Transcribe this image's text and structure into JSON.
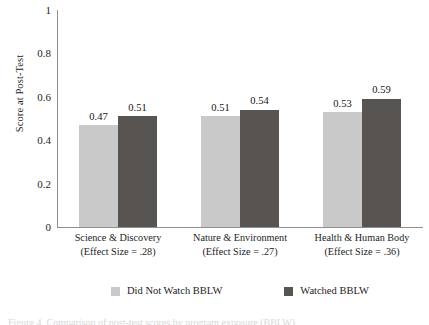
{
  "chart_data": {
    "type": "bar",
    "title": "",
    "xlabel": "",
    "ylabel": "Score at Post-Test",
    "ylim": [
      0,
      1
    ],
    "yticks": [
      "0",
      "0.2",
      "0.4",
      "0.6",
      "0.8",
      "1"
    ],
    "grid": false,
    "legend_position": "bottom",
    "categories": [
      "Science & Discovery",
      "Nature & Environment",
      "Health & Human Body"
    ],
    "category_sublabels": [
      "(Effect Size = .28)",
      "(Effect Size = .27)",
      "(Effect Size = .36)"
    ],
    "series": [
      {
        "name": "Did Not Watch BBLW",
        "color": "#c9c9c9",
        "values": [
          0.47,
          0.51,
          0.53
        ],
        "labels": [
          "0.47",
          "0.51",
          "0.53"
        ]
      },
      {
        "name": "Watched BBLW",
        "color": "#585451",
        "values": [
          0.51,
          0.54,
          0.59
        ],
        "labels": [
          "0.51",
          "0.54",
          "0.59"
        ]
      }
    ]
  },
  "axis": {
    "y_title": "Score at Post-Test",
    "y_ticks": [
      {
        "label": "1",
        "value": 1.0
      },
      {
        "label": "0.8",
        "value": 0.8
      },
      {
        "label": "0.6",
        "value": 0.6
      },
      {
        "label": "0.4",
        "value": 0.4
      },
      {
        "label": "0.2",
        "value": 0.2
      },
      {
        "label": "0",
        "value": 0.0
      }
    ]
  },
  "legend": {
    "items": [
      {
        "label": "Did Not Watch BBLW",
        "color": "#c9c9c9"
      },
      {
        "label": "Watched BBLW",
        "color": "#585451"
      }
    ]
  },
  "caption": {
    "text": "Figure 4. Comparison of post-test scores by program exposure (BBLW)."
  }
}
